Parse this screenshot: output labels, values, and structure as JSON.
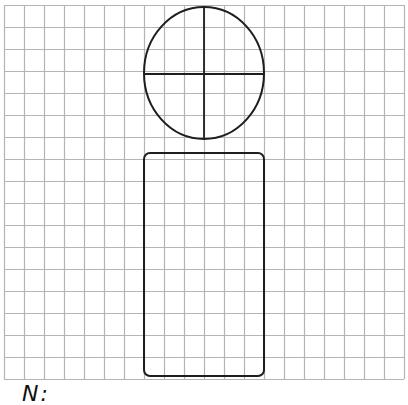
{
  "figure": {
    "grid": {
      "x0": 4,
      "y0": 5,
      "cols": 20,
      "rows": 17,
      "cell_w": 20,
      "cell_h": 22,
      "line_color": "#b4b4b4"
    },
    "shapes": {
      "stroke_color": "#1e1e1e",
      "head": {
        "type": "circle",
        "cx": 204,
        "cy": 73,
        "rx": 60,
        "ry": 66
      },
      "head_vertical_line": {
        "x1": 204,
        "y1": 7,
        "x2": 204,
        "y2": 139
      },
      "head_horizontal_line": {
        "x1": 144,
        "y1": 74,
        "x2": 264,
        "y2": 74
      },
      "body": {
        "type": "rounded-rectangle",
        "x": 144,
        "y": 153,
        "width": 120,
        "height": 223,
        "radius": 6
      }
    },
    "caption": "N:"
  }
}
